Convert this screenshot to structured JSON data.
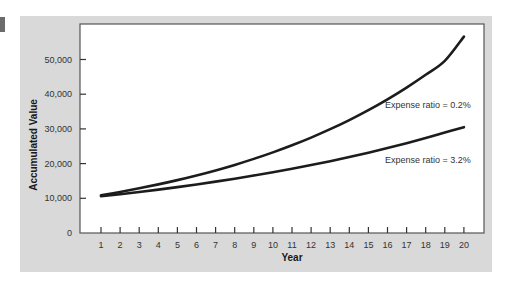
{
  "chart_data": {
    "type": "line",
    "title": "",
    "xlabel": "Year",
    "ylabel": "Accumulated Value",
    "x": [
      1,
      2,
      3,
      4,
      5,
      6,
      7,
      8,
      9,
      10,
      11,
      12,
      13,
      14,
      15,
      16,
      17,
      18,
      19,
      20
    ],
    "y_ticks": [
      0,
      10000,
      20000,
      30000,
      40000,
      50000
    ],
    "y_tick_labels": [
      "0",
      "10,000",
      "20,000",
      "30,000",
      "40,000",
      "50,000"
    ],
    "ylim": [
      0,
      60000
    ],
    "grid": false,
    "legend": "inline annotations",
    "series": [
      {
        "name": "Expense ratio = 0.2%",
        "values": [
          10880,
          11840,
          12880,
          14010,
          15240,
          16580,
          18040,
          19630,
          21360,
          23240,
          25280,
          27500,
          29920,
          32550,
          35420,
          38530,
          41920,
          45610,
          49620,
          56600
        ]
      },
      {
        "name": "Expense ratio = 3.2%",
        "values": [
          10580,
          11190,
          11830,
          12510,
          13230,
          13990,
          14800,
          15650,
          16550,
          17500,
          18510,
          19570,
          20700,
          21890,
          23150,
          24480,
          25890,
          27380,
          28950,
          30500
        ]
      }
    ],
    "annotations": [
      {
        "text": "Expense ratio = 0.2%",
        "near_year": 17,
        "y_value": 35500
      },
      {
        "text": "Expense ratio = 3.2%",
        "near_year": 17,
        "y_value": 20000
      }
    ]
  },
  "labels": {
    "xlabel": "Year",
    "ylabel": "Accumulated Value",
    "annot_top": "Expense ratio = 0.2%",
    "annot_bottom": "Expense ratio = 3.2%"
  }
}
